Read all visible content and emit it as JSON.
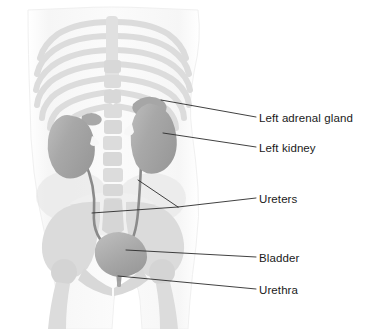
{
  "figure": {
    "background_color": "#ffffff"
  },
  "colors": {
    "organ_fill": "#a6a6a6",
    "organ_fill_light": "#b4b4b4",
    "organ_edge": "#8f8f8f",
    "ureter_stroke": "#8a8a8a",
    "bone_fill": "#dcdcdc",
    "bone_fill_soft": "#e6e6e6",
    "body_fill": "#fafafa",
    "body_edge": "#f2f2f2",
    "soft_tissue": "#e2e2e2",
    "leader_line": "#2b2b2b",
    "label_text": "#1a1a1a"
  },
  "labels": [
    {
      "id": "left-adrenal-gland",
      "text": "Left adrenal gland",
      "x": 259,
      "y": 113,
      "leader": {
        "x1": 256,
        "y1": 117,
        "x2": 161,
        "y2": 100
      }
    },
    {
      "id": "left-kidney",
      "text": "Left kidney",
      "x": 259,
      "y": 143,
      "leader": {
        "x1": 256,
        "y1": 147,
        "x2": 163,
        "y2": 133
      }
    },
    {
      "id": "ureters",
      "text": "Ureters",
      "x": 259,
      "y": 194,
      "leader": {
        "x1": 256,
        "y1": 198,
        "x2": 178,
        "y2": 207
      },
      "branches": [
        {
          "x1": 178,
          "y1": 207,
          "x2": 138,
          "y2": 180
        },
        {
          "x1": 178,
          "y1": 207,
          "x2": 92,
          "y2": 213
        }
      ]
    },
    {
      "id": "bladder",
      "text": "Bladder",
      "x": 259,
      "y": 253,
      "leader": {
        "x1": 256,
        "y1": 257,
        "x2": 126,
        "y2": 250
      }
    },
    {
      "id": "urethra",
      "text": "Urethra",
      "x": 259,
      "y": 285,
      "leader": {
        "x1": 256,
        "y1": 289,
        "x2": 118,
        "y2": 276
      }
    }
  ],
  "organs": [
    {
      "id": "right-kidney",
      "name": "Right kidney",
      "cx": 72,
      "cy": 143
    },
    {
      "id": "left-kidney-shape",
      "name": "Left kidney",
      "cx": 152,
      "cy": 135
    },
    {
      "id": "right-adrenal-gland",
      "name": "Right adrenal gland",
      "cx": 93,
      "cy": 122
    },
    {
      "id": "left-adrenal-gland-shape",
      "name": "Left adrenal gland",
      "cx": 148,
      "cy": 104
    },
    {
      "id": "bladder-shape",
      "name": "Bladder",
      "cx": 119,
      "cy": 252
    },
    {
      "id": "urethra-shape",
      "name": "Urethra",
      "cx": 119,
      "cy": 275
    },
    {
      "id": "right-ureter",
      "name": "Right ureter"
    },
    {
      "id": "left-ureter",
      "name": "Left ureter"
    }
  ],
  "skeleton": [
    {
      "id": "ribcage",
      "name": "Rib cage"
    },
    {
      "id": "spine",
      "name": "Spine / vertebral column"
    },
    {
      "id": "pelvis",
      "name": "Pelvis"
    },
    {
      "id": "femur-left",
      "name": "Left femur head"
    },
    {
      "id": "femur-right",
      "name": "Right femur head"
    }
  ]
}
